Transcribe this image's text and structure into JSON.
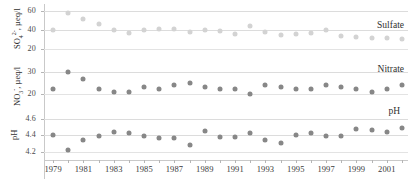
{
  "chart_data": [
    {
      "type": "scatter",
      "title": "",
      "series_label": "Sulfate",
      "ylabel": "SO4 2- , µeq/l",
      "xlabel": "",
      "ylim": [
        10,
        68
      ],
      "yticks": [
        20,
        40,
        60
      ],
      "ytick_labels": [
        "20",
        "40",
        "60"
      ],
      "grid": true,
      "x": [
        1979,
        1980,
        1981,
        1982,
        1983,
        1984,
        1985,
        1986,
        1987,
        1988,
        1989,
        1990,
        1991,
        1992,
        1993,
        1994,
        1995,
        1996,
        1997,
        1998,
        1999,
        2000,
        2001,
        2002
      ],
      "values": [
        40,
        58,
        52,
        47,
        40,
        37,
        40,
        41,
        41,
        38,
        40,
        39,
        36,
        44,
        38,
        35,
        36,
        37,
        40,
        34,
        33,
        32,
        31,
        30
      ]
    },
    {
      "type": "scatter",
      "title": "",
      "series_label": "Nitrate",
      "ylabel": "NO3 - , µeq/l",
      "xlabel": "",
      "ylim": [
        17,
        33
      ],
      "yticks": [
        20,
        30
      ],
      "ytick_labels": [
        "20",
        "30"
      ],
      "grid": true,
      "x": [
        1979,
        1980,
        1981,
        1982,
        1983,
        1984,
        1985,
        1986,
        1987,
        1988,
        1989,
        1990,
        1991,
        1992,
        1993,
        1994,
        1995,
        1996,
        1997,
        1998,
        1999,
        2000,
        2001,
        2002
      ],
      "values": [
        22,
        30,
        27,
        22,
        21,
        21,
        23,
        22,
        24,
        25,
        23,
        22,
        22,
        20,
        24,
        23,
        22,
        22,
        24,
        23,
        22,
        21,
        22,
        24
      ]
    },
    {
      "type": "scatter",
      "title": "",
      "series_label": "pH",
      "ylabel": "pH",
      "xlabel": "",
      "ylim": [
        4.13,
        4.68
      ],
      "yticks": [
        4.2,
        4.4,
        4.6
      ],
      "ytick_labels": [
        "4.2",
        "4.4",
        "4.6"
      ],
      "grid": true,
      "x": [
        1979,
        1980,
        1981,
        1982,
        1983,
        1984,
        1985,
        1986,
        1987,
        1988,
        1989,
        1990,
        1991,
        1992,
        1993,
        1994,
        1995,
        1996,
        1997,
        1998,
        1999,
        2000,
        2001,
        2002
      ],
      "values": [
        4.41,
        4.23,
        4.35,
        4.39,
        4.44,
        4.43,
        4.39,
        4.37,
        4.37,
        4.29,
        4.45,
        4.38,
        4.38,
        4.43,
        4.34,
        4.31,
        4.4,
        4.43,
        4.39,
        4.39,
        4.48,
        4.47,
        4.44,
        4.49
      ]
    }
  ],
  "axis": {
    "x_tick_years": [
      1979,
      1980,
      1981,
      1982,
      1983,
      1984,
      1985,
      1986,
      1987,
      1988,
      1989,
      1990,
      1991,
      1992,
      1993,
      1994,
      1995,
      1996,
      1997,
      1998,
      1999,
      2000,
      2001,
      2002
    ],
    "x_labeled_years": [
      "1979",
      "1981",
      "1983",
      "1985",
      "1987",
      "1989",
      "1991",
      "1993",
      "1995",
      "1997",
      "1999",
      "2001"
    ],
    "x_min": 1978.4,
    "x_max": 2002.4
  },
  "labels": {
    "sulfate_axis_title_main": "SO",
    "sulfate_axis_title_sub": "4",
    "sulfate_axis_title_sup": "2-",
    "sulfate_axis_title_tail": ", µeq/l",
    "nitrate_axis_title_main": "NO",
    "nitrate_axis_title_sub": "3",
    "nitrate_axis_title_sup": "-",
    "nitrate_axis_title_tail": ", µeq/l",
    "ph_axis_title": "pH",
    "series_sulfate": "Sulfate",
    "series_nitrate": "Nitrate",
    "series_ph": "pH"
  },
  "colors": {
    "point": "#878787",
    "point_light": "#d3d3d3",
    "grid": "#e3e3e3",
    "axis": "#c9c9c9",
    "text": "#3a3a3a",
    "background": "#ffffff"
  }
}
